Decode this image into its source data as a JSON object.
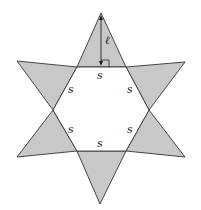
{
  "figure": {
    "colors": {
      "triangle_fill": "#c8c8c8",
      "stroke": "#333333",
      "hexagon_fill": "#ffffff"
    },
    "hexagon": {
      "side_labels": [
        "s",
        "s",
        "s",
        "s",
        "s",
        "s"
      ]
    },
    "height_label": "ℓ",
    "right_angle_marker": true
  }
}
